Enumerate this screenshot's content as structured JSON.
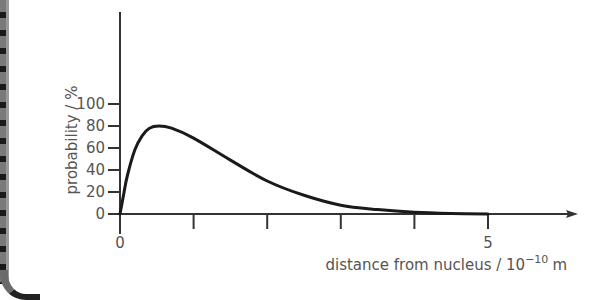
{
  "chart_data": {
    "type": "line",
    "title": "",
    "xlabel": "distance from nucleus / 10",
    "xlabel_exponent": "−10",
    "xlabel_unit": "m",
    "ylabel": "probability / %",
    "xlim": [
      0,
      6.2
    ],
    "ylim": [
      0,
      110
    ],
    "x_ticks": [
      0,
      1,
      2,
      3,
      4,
      5
    ],
    "x_tick_labels": [
      "0",
      "",
      "",
      "",
      "",
      "5"
    ],
    "y_ticks": [
      0,
      20,
      40,
      60,
      80,
      100
    ],
    "y_tick_labels": [
      "0",
      "20",
      "40",
      "60",
      "80",
      "100"
    ],
    "grid": false,
    "legend": null,
    "series": [
      {
        "name": "probability",
        "x": [
          0,
          0.05,
          0.1,
          0.2,
          0.3,
          0.4,
          0.53,
          0.7,
          1.0,
          1.5,
          2.0,
          2.5,
          3.0,
          3.5,
          4.0,
          4.5,
          5.0
        ],
        "y": [
          0,
          18,
          35,
          58,
          71,
          78,
          80,
          78,
          69,
          49,
          30,
          17,
          8,
          4,
          1.5,
          0.5,
          0
        ]
      }
    ],
    "color": "#1a1a1a"
  }
}
